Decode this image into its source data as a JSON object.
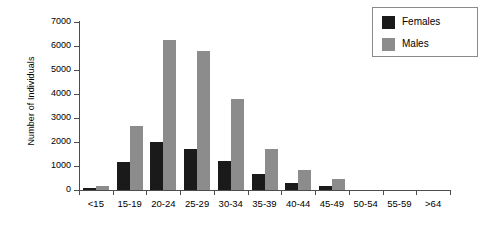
{
  "chart_data": {
    "type": "bar",
    "title": "",
    "xlabel": "",
    "ylabel": "Number of Individuals",
    "ylim": [
      0,
      7000
    ],
    "ytick_values": [
      0,
      1000,
      2000,
      3000,
      4000,
      5000,
      6000,
      7000
    ],
    "ytick_labels": [
      "0",
      "1000",
      "2000",
      "3000",
      "4000",
      "5000",
      "6000",
      "7000"
    ],
    "grid": false,
    "legend_position": "top-right",
    "categories": [
      "<15",
      "15-19",
      "20-24",
      "25-29",
      "30-34",
      "35-39",
      "40-44",
      "45-49",
      "50-54",
      "55-59",
      ">64"
    ],
    "series": [
      {
        "name": "Females",
        "color": "#1a1a1a",
        "values": [
          100,
          1150,
          2000,
          1700,
          1200,
          650,
          300,
          180,
          0,
          0,
          0
        ]
      },
      {
        "name": "Males",
        "color": "#8c8c8c",
        "values": [
          170,
          2650,
          6250,
          5800,
          3800,
          1700,
          820,
          450,
          0,
          0,
          0
        ]
      }
    ]
  },
  "legend": {
    "entries": [
      {
        "label": "Females"
      },
      {
        "label": "Males"
      }
    ]
  }
}
